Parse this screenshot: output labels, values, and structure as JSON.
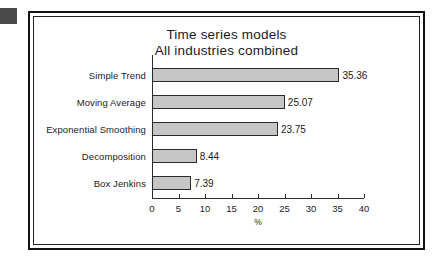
{
  "chart_data": {
    "type": "bar",
    "orientation": "horizontal",
    "title": "Time series models\nAll industries combined",
    "title_line1": "Time series models",
    "title_line2": "All industries combined",
    "categories": [
      "Simple Trend",
      "Moving Average",
      "Exponential Smoothing",
      "Decomposition",
      "Box Jenkins"
    ],
    "values": [
      35.36,
      25.07,
      23.75,
      8.44,
      7.39
    ],
    "value_labels": [
      "35.36",
      "25.07",
      "23.75",
      "8.44",
      "7.39"
    ],
    "xlabel": "%",
    "ylabel": "",
    "xlim": [
      0,
      40
    ],
    "xticks": [
      0,
      5,
      10,
      15,
      20,
      25,
      30,
      35,
      40
    ],
    "xtick_labels": [
      "0",
      "5",
      "10",
      "15",
      "20",
      "25",
      "30",
      "35",
      "40"
    ],
    "grid": false,
    "legend": false,
    "bar_fill_color": "#c6c6c6",
    "bar_border_color": "#2b2b2b",
    "axis_color": "#2b2b2b",
    "background_color": "#ffffff",
    "frame_color": "#111111",
    "marker_color": "#4a4a4a"
  }
}
